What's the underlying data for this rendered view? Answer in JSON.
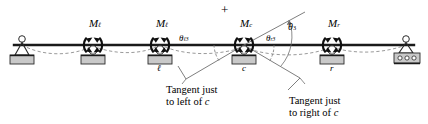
{
  "figure": {
    "type": "structural-beam-diagram",
    "colors": {
      "beam": "#1a1a1a",
      "deflection_curve": "#8a8a8a",
      "tangent_line": "#6f6f6f",
      "support_fill": "#c9c9c9",
      "support_stroke": "#2b2b2b",
      "text": "#000000"
    }
  },
  "labels": {
    "moment_left": {
      "base": "M",
      "sub": "ℓ"
    },
    "moment_center": {
      "base": "M",
      "sub": "c"
    },
    "moment_right": {
      "base": "M",
      "sub": "r"
    },
    "plus_sign": "+",
    "theta_left": {
      "base": "θ",
      "sub": "ℓ3"
    },
    "theta_right": {
      "base": "θ",
      "sub": "r3"
    },
    "theta_total": {
      "base": "θ",
      "sub": "3"
    },
    "point_left": "ℓ",
    "point_center": "c",
    "point_right": "r"
  },
  "annotations": {
    "tangent_left": {
      "line1": "Tangent just",
      "line2": "to left of ",
      "italic_end": "c"
    },
    "tangent_right": {
      "line1": "Tangent just",
      "line2": "to right of ",
      "italic_end": "c"
    }
  },
  "supports": [
    {
      "name": "pin-support-left",
      "x": 22,
      "kind": "pin"
    },
    {
      "name": "roller-support-a",
      "x": 93,
      "kind": "roller"
    },
    {
      "name": "roller-support-l",
      "x": 160,
      "kind": "roller",
      "point": "ℓ"
    },
    {
      "name": "roller-support-c",
      "x": 244,
      "kind": "roller",
      "point": "c"
    },
    {
      "name": "roller-support-r",
      "x": 332,
      "kind": "roller",
      "point": "r"
    },
    {
      "name": "roller-support-right-end",
      "x": 406,
      "kind": "rocker"
    }
  ],
  "geometry": {
    "beam_y": 45,
    "beam_x_start": 14,
    "beam_x_end": 414
  }
}
